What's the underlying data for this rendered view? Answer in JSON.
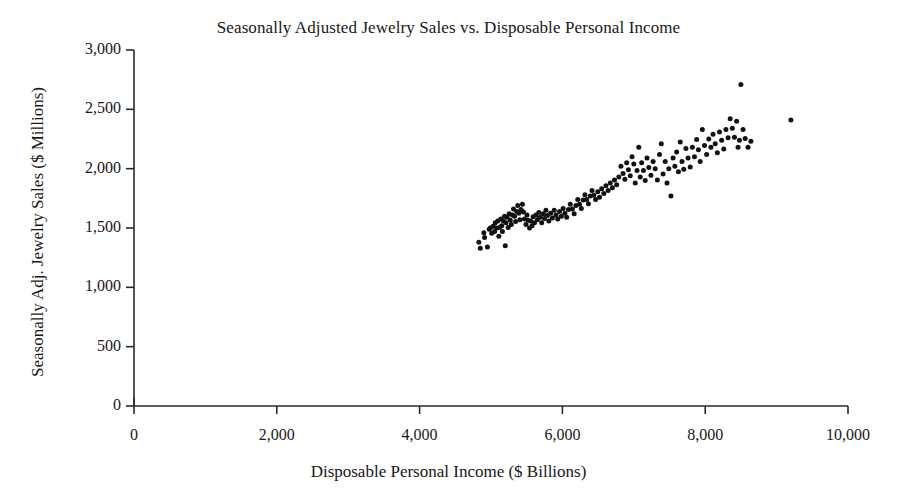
{
  "chart_data": {
    "type": "scatter",
    "title": "Seasonally Adjusted Jewelry Sales vs. Disposable Personal Income",
    "xlabel": "Disposable Personal Income ($ Billions)",
    "ylabel": "Seasonally Adj. Jewelry Sales ($ Millions)",
    "xlim": [
      0,
      10000
    ],
    "ylim": [
      0,
      3000
    ],
    "xticks": [
      0,
      2000,
      4000,
      6000,
      8000,
      10000
    ],
    "yticks": [
      0,
      500,
      1000,
      1500,
      2000,
      2500,
      3000
    ],
    "xtick_labels": [
      "0",
      "2,000",
      "4,000",
      "6,000",
      "8,000",
      "10,000"
    ],
    "ytick_labels": [
      "0",
      "500",
      "1,000",
      "1,500",
      "2,000",
      "2,500",
      "3,000"
    ],
    "grid": false,
    "legend": null,
    "marker": {
      "shape": "circle",
      "color": "#111111",
      "size_px": 5
    },
    "series": [
      {
        "name": "Jewelry Sales vs. Disposable Personal Income",
        "points": [
          [
            4830,
            1380
          ],
          [
            4850,
            1330
          ],
          [
            4900,
            1460
          ],
          [
            4910,
            1420
          ],
          [
            4950,
            1340
          ],
          [
            4975,
            1490
          ],
          [
            4990,
            1500
          ],
          [
            5010,
            1455
          ],
          [
            5030,
            1515
          ],
          [
            5050,
            1470
          ],
          [
            5060,
            1545
          ],
          [
            5080,
            1500
          ],
          [
            5095,
            1560
          ],
          [
            5110,
            1430
          ],
          [
            5120,
            1505
          ],
          [
            5135,
            1575
          ],
          [
            5150,
            1520
          ],
          [
            5160,
            1470
          ],
          [
            5175,
            1560
          ],
          [
            5190,
            1600
          ],
          [
            5200,
            1350
          ],
          [
            5210,
            1545
          ],
          [
            5225,
            1590
          ],
          [
            5240,
            1505
          ],
          [
            5255,
            1620
          ],
          [
            5270,
            1565
          ],
          [
            5285,
            1530
          ],
          [
            5300,
            1610
          ],
          [
            5315,
            1660
          ],
          [
            5330,
            1600
          ],
          [
            5345,
            1555
          ],
          [
            5360,
            1640
          ],
          [
            5375,
            1690
          ],
          [
            5390,
            1625
          ],
          [
            5405,
            1570
          ],
          [
            5420,
            1655
          ],
          [
            5440,
            1700
          ],
          [
            5455,
            1635
          ],
          [
            5470,
            1575
          ],
          [
            5490,
            1530
          ],
          [
            5505,
            1610
          ],
          [
            5520,
            1565
          ],
          [
            5540,
            1500
          ],
          [
            5555,
            1560
          ],
          [
            5575,
            1520
          ],
          [
            5590,
            1595
          ],
          [
            5610,
            1545
          ],
          [
            5630,
            1610
          ],
          [
            5650,
            1570
          ],
          [
            5670,
            1630
          ],
          [
            5690,
            1590
          ],
          [
            5710,
            1545
          ],
          [
            5730,
            1620
          ],
          [
            5750,
            1580
          ],
          [
            5770,
            1650
          ],
          [
            5790,
            1605
          ],
          [
            5810,
            1560
          ],
          [
            5835,
            1625
          ],
          [
            5860,
            1585
          ],
          [
            5885,
            1650
          ],
          [
            5910,
            1610
          ],
          [
            5935,
            1575
          ],
          [
            5960,
            1640
          ],
          [
            5985,
            1600
          ],
          [
            6010,
            1665
          ],
          [
            6035,
            1625
          ],
          [
            6060,
            1590
          ],
          [
            6085,
            1655
          ],
          [
            6110,
            1700
          ],
          [
            6140,
            1660
          ],
          [
            6165,
            1620
          ],
          [
            6190,
            1690
          ],
          [
            6215,
            1740
          ],
          [
            6240,
            1700
          ],
          [
            6265,
            1665
          ],
          [
            6290,
            1735
          ],
          [
            6315,
            1780
          ],
          [
            6340,
            1740
          ],
          [
            6365,
            1705
          ],
          [
            6390,
            1770
          ],
          [
            6415,
            1815
          ],
          [
            6440,
            1775
          ],
          [
            6465,
            1740
          ],
          [
            6495,
            1805
          ],
          [
            6520,
            1760
          ],
          [
            6550,
            1830
          ],
          [
            6580,
            1790
          ],
          [
            6610,
            1855
          ],
          [
            6640,
            1815
          ],
          [
            6670,
            1880
          ],
          [
            6700,
            1840
          ],
          [
            6730,
            1905
          ],
          [
            6760,
            1865
          ],
          [
            6790,
            1930
          ],
          [
            6820,
            2020
          ],
          [
            6850,
            1960
          ],
          [
            6875,
            1910
          ],
          [
            6900,
            2050
          ],
          [
            6925,
            1990
          ],
          [
            6950,
            1940
          ],
          [
            6975,
            2100
          ],
          [
            7000,
            2040
          ],
          [
            7020,
            1880
          ],
          [
            7045,
            1985
          ],
          [
            7070,
            2180
          ],
          [
            7090,
            1930
          ],
          [
            7110,
            2050
          ],
          [
            7135,
            1985
          ],
          [
            7160,
            1900
          ],
          [
            7185,
            2090
          ],
          [
            7210,
            2010
          ],
          [
            7240,
            1945
          ],
          [
            7270,
            2060
          ],
          [
            7300,
            2000
          ],
          [
            7330,
            1905
          ],
          [
            7360,
            2120
          ],
          [
            7385,
            2210
          ],
          [
            7410,
            1955
          ],
          [
            7440,
            2060
          ],
          [
            7465,
            1880
          ],
          [
            7490,
            2000
          ],
          [
            7520,
            1770
          ],
          [
            7550,
            2090
          ],
          [
            7575,
            2020
          ],
          [
            7600,
            2140
          ],
          [
            7625,
            1975
          ],
          [
            7650,
            2225
          ],
          [
            7675,
            2060
          ],
          [
            7700,
            1995
          ],
          [
            7730,
            2170
          ],
          [
            7760,
            2090
          ],
          [
            7790,
            2015
          ],
          [
            7820,
            2180
          ],
          [
            7850,
            2100
          ],
          [
            7880,
            2245
          ],
          [
            7905,
            2160
          ],
          [
            7930,
            2060
          ],
          [
            7960,
            2330
          ],
          [
            7990,
            2195
          ],
          [
            8020,
            2120
          ],
          [
            8050,
            2250
          ],
          [
            8080,
            2180
          ],
          [
            8110,
            2290
          ],
          [
            8140,
            2210
          ],
          [
            8170,
            2135
          ],
          [
            8200,
            2310
          ],
          [
            8230,
            2240
          ],
          [
            8260,
            2165
          ],
          [
            8290,
            2330
          ],
          [
            8320,
            2260
          ],
          [
            8350,
            2420
          ],
          [
            8380,
            2340
          ],
          [
            8410,
            2265
          ],
          [
            8440,
            2400
          ],
          [
            8460,
            2180
          ],
          [
            8480,
            2240
          ],
          [
            8500,
            2710
          ],
          [
            8530,
            2330
          ],
          [
            8560,
            2255
          ],
          [
            8600,
            2180
          ],
          [
            8640,
            2230
          ],
          [
            9200,
            2410
          ]
        ]
      }
    ]
  }
}
